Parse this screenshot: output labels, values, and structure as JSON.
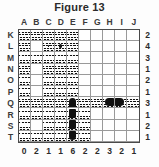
{
  "figure": {
    "title": "Figure 13"
  },
  "board": {
    "column_headers": [
      "A",
      "B",
      "C",
      "D",
      "E",
      "F",
      "G",
      "H",
      "I",
      "J"
    ],
    "row_headers": [
      "K",
      "L",
      "M",
      "N",
      "O",
      "P",
      "Q",
      "R",
      "S",
      "T"
    ],
    "row_counts": [
      2,
      4,
      3,
      1,
      2,
      1,
      3,
      1,
      2,
      1
    ],
    "column_counts": [
      0,
      2,
      1,
      1,
      6,
      2,
      2,
      3,
      2,
      1
    ],
    "cells": [
      [
        "water",
        "water",
        "water",
        "water",
        "water",
        "empty",
        "empty",
        "empty",
        "empty",
        "empty"
      ],
      [
        "water",
        "empty",
        "dot",
        "sub",
        "water",
        "empty",
        "empty",
        "empty",
        "empty",
        "empty"
      ],
      [
        "water",
        "water",
        "water",
        "water",
        "water",
        "empty",
        "empty",
        "empty",
        "empty",
        "empty"
      ],
      [
        "water",
        "empty",
        "water",
        "water",
        "water",
        "empty",
        "empty",
        "empty",
        "empty",
        "empty"
      ],
      [
        "water",
        "empty",
        "water",
        "water",
        "water",
        "empty",
        "empty",
        "empty",
        "empty",
        "empty"
      ],
      [
        "water",
        "empty",
        "water",
        "water",
        "water",
        "empty",
        "empty",
        "empty",
        "empty",
        "empty"
      ],
      [
        "water",
        "water",
        "water",
        "water",
        "v-top",
        "water",
        "water",
        "h-left",
        "h-right",
        "water"
      ],
      [
        "water",
        "water",
        "water",
        "water",
        "v-mid",
        "water",
        "empty",
        "empty",
        "empty",
        "empty"
      ],
      [
        "water",
        "empty",
        "water",
        "water",
        "v-mid",
        "water",
        "empty",
        "empty",
        "empty",
        "empty"
      ],
      [
        "water",
        "water",
        "water",
        "water",
        "v-bot",
        "water",
        "empty",
        "empty",
        "empty",
        "empty"
      ]
    ]
  }
}
